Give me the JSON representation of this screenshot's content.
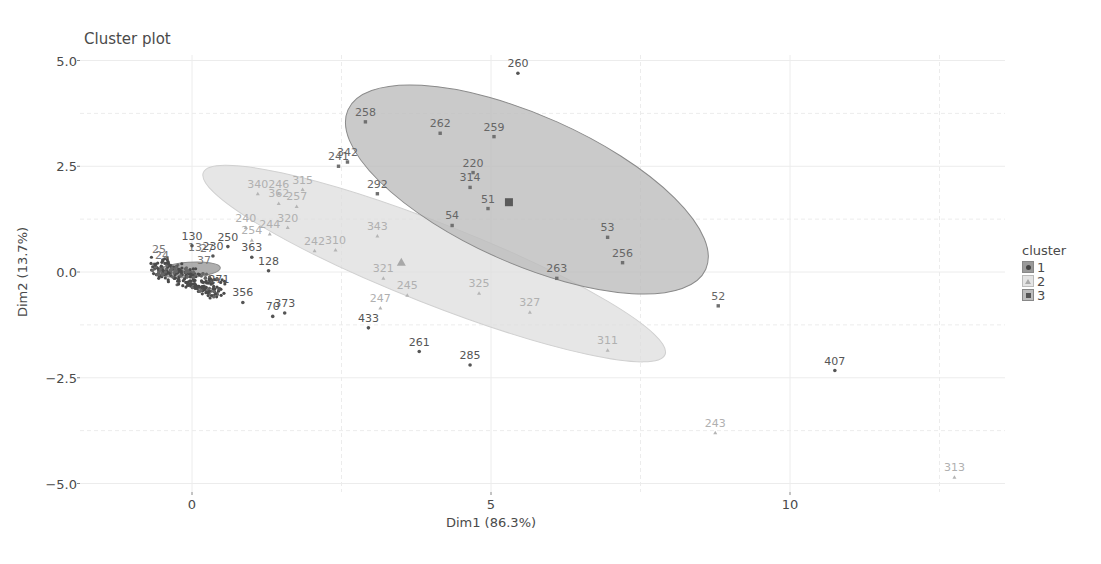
{
  "chart_data": {
    "type": "scatter",
    "title": "Cluster plot",
    "xlabel": "Dim1 (86.3%)",
    "ylabel": "Dim2 (13.7%)",
    "xlim": [
      -1.5,
      13.5
    ],
    "ylim": [
      -5.4,
      5.3
    ],
    "x_ticks": [
      0,
      5,
      10
    ],
    "y_ticks": [
      5.0,
      2.5,
      0.0,
      -2.5,
      -5.0
    ],
    "y_tick_labels": [
      "5.0",
      "2.5",
      "0.0",
      "−2.5",
      "−5.0"
    ],
    "grid": true,
    "legend_position": "right",
    "legend": {
      "title": "cluster",
      "entries": [
        "1",
        "2",
        "3"
      ]
    },
    "series": [
      {
        "name": "1",
        "marker": "circle",
        "color": "#555555",
        "ellipse": {
          "cx": -0.05,
          "cy": 0.05,
          "rx": 1.05,
          "ry": 0.18,
          "angle": -4,
          "fill": "#9a9a9a"
        },
        "points": [
          {
            "label": "130",
            "x": 0.0,
            "y": 0.62
          },
          {
            "label": "250",
            "x": 0.6,
            "y": 0.6
          },
          {
            "label": "230",
            "x": 0.35,
            "y": 0.38
          },
          {
            "label": "363",
            "x": 1.0,
            "y": 0.35
          },
          {
            "label": "128",
            "x": 1.28,
            "y": 0.03
          },
          {
            "label": "271",
            "x": 0.45,
            "y": -0.4
          },
          {
            "label": "356",
            "x": 0.85,
            "y": -0.72
          },
          {
            "label": "70",
            "x": 1.35,
            "y": -1.05
          },
          {
            "label": "373",
            "x": 1.55,
            "y": -0.97
          },
          {
            "label": "433",
            "x": 2.95,
            "y": -1.32
          },
          {
            "label": "261",
            "x": 3.8,
            "y": -1.88
          },
          {
            "label": "285",
            "x": 4.65,
            "y": -2.2
          },
          {
            "label": "407",
            "x": 10.75,
            "y": -2.33
          },
          {
            "label": "260",
            "x": 5.45,
            "y": 4.7
          }
        ]
      },
      {
        "name": "2",
        "marker": "triangle",
        "color": "#b5b5b5",
        "centroid": {
          "x": 3.5,
          "y": 0.22
        },
        "ellipse": {
          "cx": 4.05,
          "cy": 0.2,
          "rx": 8.3,
          "ry": 0.95,
          "angle": 21.5,
          "fill": "#dedede"
        },
        "points": [
          {
            "label": "340",
            "x": 1.1,
            "y": 1.85
          },
          {
            "label": "246",
            "x": 1.45,
            "y": 1.85
          },
          {
            "label": "362",
            "x": 1.45,
            "y": 1.62
          },
          {
            "label": "257",
            "x": 1.75,
            "y": 1.55
          },
          {
            "label": "315",
            "x": 1.85,
            "y": 1.95
          },
          {
            "label": "240",
            "x": 0.9,
            "y": 1.05
          },
          {
            "label": "244",
            "x": 1.3,
            "y": 0.9
          },
          {
            "label": "320",
            "x": 1.6,
            "y": 1.05
          },
          {
            "label": "254",
            "x": 1.0,
            "y": 0.75
          },
          {
            "label": "242",
            "x": 2.05,
            "y": 0.5
          },
          {
            "label": "310",
            "x": 2.4,
            "y": 0.52
          },
          {
            "label": "343",
            "x": 3.1,
            "y": 0.85
          },
          {
            "label": "321",
            "x": 3.2,
            "y": -0.15
          },
          {
            "label": "245",
            "x": 3.6,
            "y": -0.55
          },
          {
            "label": "247",
            "x": 3.15,
            "y": -0.85
          },
          {
            "label": "325",
            "x": 4.8,
            "y": -0.5
          },
          {
            "label": "327",
            "x": 5.65,
            "y": -0.95
          },
          {
            "label": "311",
            "x": 6.95,
            "y": -1.85
          },
          {
            "label": "243",
            "x": 8.75,
            "y": -3.8
          },
          {
            "label": "313",
            "x": 12.75,
            "y": -4.85
          }
        ]
      },
      {
        "name": "3",
        "marker": "square",
        "color": "#707070",
        "centroid": {
          "x": 5.3,
          "y": 1.65
        },
        "ellipse": {
          "cx": 5.6,
          "cy": 1.95,
          "rx": 6.55,
          "ry": 1.75,
          "angle": 24,
          "fill": "#bdbdbd"
        },
        "points": [
          {
            "label": "258",
            "x": 2.9,
            "y": 3.55
          },
          {
            "label": "262",
            "x": 4.15,
            "y": 3.28
          },
          {
            "label": "259",
            "x": 5.05,
            "y": 3.2
          },
          {
            "label": "241",
            "x": 2.45,
            "y": 2.5
          },
          {
            "label": "342",
            "x": 2.6,
            "y": 2.6
          },
          {
            "label": "292",
            "x": 3.1,
            "y": 1.85
          },
          {
            "label": "220",
            "x": 4.7,
            "y": 2.35
          },
          {
            "label": "314",
            "x": 4.65,
            "y": 2.0
          },
          {
            "label": "51",
            "x": 4.95,
            "y": 1.5
          },
          {
            "label": "54",
            "x": 4.35,
            "y": 1.1
          },
          {
            "label": "53",
            "x": 6.95,
            "y": 0.82
          },
          {
            "label": "256",
            "x": 7.2,
            "y": 0.22
          },
          {
            "label": "263",
            "x": 6.1,
            "y": -0.15
          },
          {
            "label": "52",
            "x": 8.8,
            "y": -0.8
          }
        ]
      }
    ]
  },
  "legend": {
    "title": "cluster",
    "items": [
      "1",
      "2",
      "3"
    ]
  },
  "axes": {
    "title": "Cluster plot",
    "xlabel": "Dim1 (86.3%)",
    "ylabel": "Dim2 (13.7%)"
  }
}
